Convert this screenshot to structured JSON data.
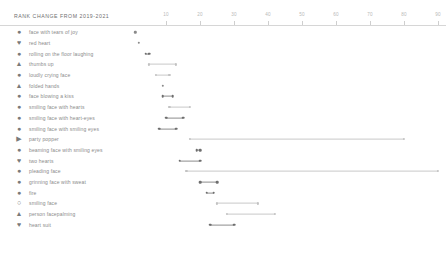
{
  "header": {
    "title": "RANK CHANGE FROM 2019-2021"
  },
  "axis": {
    "ticks": [
      10,
      20,
      30,
      40,
      50,
      60,
      70,
      80,
      90
    ],
    "tick_labels": [
      "10",
      "20",
      "30",
      "40",
      "50",
      "60",
      "70",
      "80",
      "90"
    ],
    "range": [
      0,
      100
    ],
    "position": "top",
    "axis_color": "#d6d6d6",
    "label_color": "#b9b9b9"
  },
  "style": {
    "dot_color": "#6e6e6e",
    "line_color": "#8d8d8d",
    "light_color": "#c2c2c2",
    "background": "#ffffff",
    "text_color": "#8a8a8a"
  },
  "chart_data": {
    "type": "scatter",
    "title": "RANK CHANGE FROM 2019-2021",
    "subtitle": "",
    "xlabel": "",
    "ylabel": "",
    "xlim": [
      0,
      100
    ],
    "grid": false,
    "legend": "none",
    "orientation": "horizontal",
    "mark": "dumbbell",
    "categories": [
      "face with tears of joy",
      "red heart",
      "rolling on the floor laughing",
      "thumbs up",
      "loudly crying face",
      "folded hands",
      "face blowing a kiss",
      "smiling face with hearts",
      "smiling face with heart-eyes",
      "smiling face with smiling eyes",
      "party popper",
      "beaming face with smiling eyes",
      "two hearts",
      "pleading face",
      "grinning face with sweat",
      "fire",
      "smiling face",
      "person facepalming",
      "heart suit"
    ],
    "series": [
      {
        "name": "2019 rank",
        "values": [
          1,
          2,
          4,
          5,
          7,
          9,
          9,
          11,
          10,
          14,
          17,
          19,
          14,
          16,
          20,
          19,
          22,
          23,
          23
        ]
      },
      {
        "name": "2021 rank",
        "values": [
          1,
          2,
          5,
          13,
          11,
          9,
          12,
          17,
          15,
          80,
          18,
          24,
          90,
          22,
          20,
          28,
          37,
          42,
          27
        ]
      }
    ],
    "rows": [
      {
        "icon": "face-with-tears-of-joy",
        "glyph": "●",
        "label": "face with tears of joy",
        "start": 1,
        "end": 1,
        "emphasis": "dark"
      },
      {
        "icon": "red-heart",
        "glyph": "♥",
        "label": "red heart",
        "start": 2,
        "end": 2,
        "emphasis": "dark"
      },
      {
        "icon": "rolling-on-the-floor-laughing",
        "glyph": "●",
        "label": "rolling on the floor laughing",
        "start": 4,
        "end": 5,
        "emphasis": "dark"
      },
      {
        "icon": "thumbs-up",
        "glyph": "▲",
        "label": "thumbs up",
        "start": 5,
        "end": 13,
        "emphasis": "light"
      },
      {
        "icon": "loudly-crying-face",
        "glyph": "●",
        "label": "loudly crying face",
        "start": 7,
        "end": 11,
        "emphasis": "light"
      },
      {
        "icon": "folded-hands",
        "glyph": "▲",
        "label": "folded hands",
        "start": 9,
        "end": 9,
        "emphasis": "dark"
      },
      {
        "icon": "face-blowing-a-kiss",
        "glyph": "●",
        "label": "face blowing a kiss",
        "start": 9,
        "end": 12,
        "emphasis": "dark"
      },
      {
        "icon": "smiling-face-with-hearts",
        "glyph": "●",
        "label": "smiling face with hearts",
        "start": 11,
        "end": 17,
        "emphasis": "light"
      },
      {
        "icon": "smiling-face-with-heart-eyes",
        "glyph": "●",
        "label": "smiling face with heart-eyes",
        "start": 10,
        "end": 15,
        "emphasis": "dark"
      },
      {
        "icon": "smiling-face-with-smiling-eyes",
        "glyph": "●",
        "label": "smiling face with smiling eyes",
        "start": 8,
        "end": 13,
        "emphasis": "dark"
      },
      {
        "icon": "party-popper",
        "glyph": "▶",
        "label": "party popper",
        "start": 17,
        "end": 80,
        "emphasis": "light"
      },
      {
        "icon": "beaming-face-with-smiling-eyes",
        "glyph": "●",
        "label": "beaming face with smiling eyes",
        "start": 19,
        "end": 20,
        "emphasis": "dark"
      },
      {
        "icon": "two-hearts",
        "glyph": "♥",
        "label": "two hearts",
        "start": 14,
        "end": 20,
        "emphasis": "dark"
      },
      {
        "icon": "pleading-face",
        "glyph": "●",
        "label": "pleading face",
        "start": 16,
        "end": 90,
        "emphasis": "light"
      },
      {
        "icon": "grinning-face-with-sweat",
        "glyph": "●",
        "label": "grinning face with sweat",
        "start": 20,
        "end": 25,
        "emphasis": "dark"
      },
      {
        "icon": "fire",
        "glyph": "●",
        "label": "fire",
        "start": 22,
        "end": 24,
        "emphasis": "dark"
      },
      {
        "icon": "smiling-face",
        "glyph": "○",
        "label": "smiling face",
        "start": 25,
        "end": 37,
        "emphasis": "light"
      },
      {
        "icon": "person-facepalming",
        "glyph": "▲",
        "label": "person facepalming",
        "start": 28,
        "end": 42,
        "emphasis": "light"
      },
      {
        "icon": "heart-suit",
        "glyph": "♥",
        "label": "heart suit",
        "start": 23,
        "end": 30,
        "emphasis": "dark"
      }
    ]
  }
}
